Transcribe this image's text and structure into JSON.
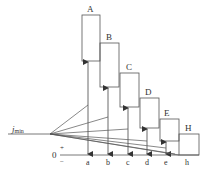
{
  "diagram": {
    "type": "tolerance-chain-diagram",
    "colors": {
      "stroke": "#555555",
      "text": "#333333",
      "background": "#ffffff"
    },
    "reference_label": {
      "main": "j",
      "sub": "min"
    },
    "zero_label": "0",
    "plus_label": "+",
    "minus_label": "−",
    "boxes": [
      {
        "label": "A",
        "x": 82,
        "top": 15,
        "bottom": 61,
        "width": 18
      },
      {
        "label": "B",
        "x": 100,
        "top": 43,
        "bottom": 87,
        "width": 19
      },
      {
        "label": "C",
        "x": 120,
        "top": 73,
        "bottom": 107,
        "width": 19
      },
      {
        "label": "D",
        "x": 140,
        "top": 98,
        "bottom": 128,
        "width": 19
      },
      {
        "label": "E",
        "x": 160,
        "top": 119,
        "bottom": 141,
        "width": 19
      },
      {
        "label": "H",
        "x": 179,
        "top": 134,
        "bottom": 155,
        "width": 20
      }
    ],
    "axis_labels": [
      {
        "label": "a",
        "x": 88
      },
      {
        "label": "b",
        "x": 108
      },
      {
        "label": "c",
        "x": 128
      },
      {
        "label": "d",
        "x": 147
      },
      {
        "label": "e",
        "x": 166
      },
      {
        "label": "h",
        "x": 187
      }
    ],
    "fan_origin": {
      "x": 50,
      "y": 134
    },
    "fan_targets": [
      {
        "x": 88,
        "y": 105
      },
      {
        "x": 108,
        "y": 117
      },
      {
        "x": 128,
        "y": 129
      },
      {
        "x": 147,
        "y": 141
      },
      {
        "x": 166,
        "y": 148
      },
      {
        "x": 179,
        "y": 155
      }
    ]
  }
}
